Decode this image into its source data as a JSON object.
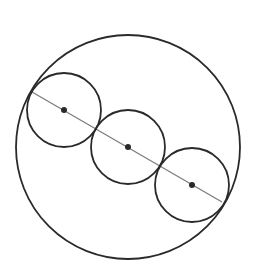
{
  "diagram": {
    "width": 266,
    "height": 275,
    "background": "#ffffff",
    "stroke_color": "#2a2a2a",
    "line_color": "#7a7a7a",
    "outer_circle": {
      "cx": 128,
      "cy": 147,
      "r": 112
    },
    "inner_circles": [
      {
        "cx": 64,
        "cy": 110,
        "r": 37
      },
      {
        "cx": 128,
        "cy": 147,
        "r": 37
      },
      {
        "cx": 192,
        "cy": 185,
        "r": 37
      }
    ],
    "center_points": [
      {
        "cx": 64,
        "cy": 110,
        "r": 3
      },
      {
        "cx": 128,
        "cy": 147,
        "r": 3
      },
      {
        "cx": 192,
        "cy": 185,
        "r": 3
      }
    ],
    "diameter_line": {
      "x1": 32,
      "y1": 92,
      "x2": 222,
      "y2": 202
    }
  }
}
